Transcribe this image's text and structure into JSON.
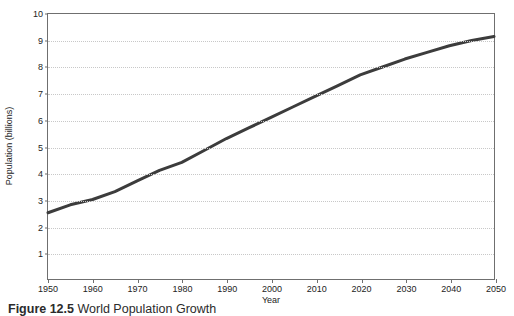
{
  "figure": {
    "caption_label": "Figure 12.5",
    "caption_text": "World Population Growth"
  },
  "chart_data": {
    "type": "line",
    "title": "",
    "xlabel": "Year",
    "ylabel": "Population (billions)",
    "xlim": [
      1950,
      2050
    ],
    "ylim": [
      0,
      10
    ],
    "grid": true,
    "legend": false,
    "xticks": [
      1950,
      1960,
      1970,
      1980,
      1990,
      2000,
      2010,
      2020,
      2030,
      2040,
      2050
    ],
    "yticks": [
      1,
      2,
      3,
      4,
      5,
      6,
      7,
      8,
      9,
      10
    ],
    "line_color": "#3c3c3c",
    "line_width": 3,
    "x": [
      1950,
      1955,
      1960,
      1965,
      1970,
      1975,
      1980,
      1985,
      1990,
      1995,
      2000,
      2005,
      2010,
      2015,
      2020,
      2025,
      2030,
      2035,
      2040,
      2045,
      2050
    ],
    "values": [
      2.5,
      2.8,
      3.0,
      3.3,
      3.7,
      4.1,
      4.4,
      4.85,
      5.3,
      5.7,
      6.1,
      6.5,
      6.9,
      7.3,
      7.7,
      8.0,
      8.3,
      8.55,
      8.8,
      9.0,
      9.15
    ],
    "series": [
      {
        "name": "World population",
        "values": [
          2.5,
          2.8,
          3.0,
          3.3,
          3.7,
          4.1,
          4.4,
          4.85,
          5.3,
          5.7,
          6.1,
          6.5,
          6.9,
          7.3,
          7.7,
          8.0,
          8.3,
          8.55,
          8.8,
          9.0,
          9.15
        ]
      }
    ]
  }
}
